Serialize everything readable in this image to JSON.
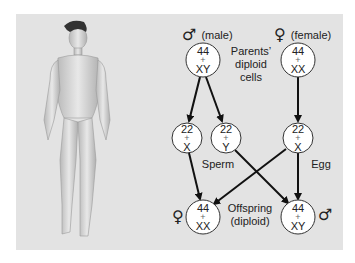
{
  "figure": {
    "background_color": "#e3e3e3"
  },
  "parents": {
    "male": {
      "symbol": "♂",
      "label": "(male)",
      "top": "44",
      "plus": "+",
      "bottom": "XY"
    },
    "female": {
      "symbol": "♀",
      "label": "(female)",
      "top": "44",
      "plus": "+",
      "bottom": "XX"
    },
    "caption_lines": [
      "Parents’",
      "diploid",
      "cells"
    ]
  },
  "gametes": {
    "sperm_x": {
      "top": "22",
      "plus": "+",
      "bottom": "X"
    },
    "sperm_y": {
      "top": "22",
      "plus": "+",
      "bottom": "Y"
    },
    "egg": {
      "top": "22",
      "plus": "+",
      "bottom": "X"
    },
    "sperm_label": "Sperm",
    "egg_label": "Egg"
  },
  "offspring": {
    "female": {
      "symbol": "♀",
      "top": "44",
      "plus": "+",
      "bottom": "XX"
    },
    "male": {
      "symbol": "♂",
      "top": "44",
      "plus": "+",
      "bottom": "XY"
    },
    "caption_lines": [
      "Offspring",
      "(diploid)"
    ]
  }
}
